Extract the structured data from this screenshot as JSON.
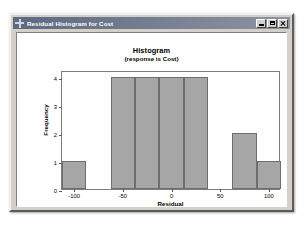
{
  "window": {
    "title": "Residual Histogram for Cost",
    "system_icon": "crosshair-icon",
    "buttons": {
      "minimize": "Minimize",
      "maximize": "Maximize",
      "close": "Close"
    }
  },
  "chart_data": {
    "type": "bar",
    "title": "Histogram",
    "subtitle": "(response is Cost)",
    "xlabel": "Residual",
    "ylabel": "Frequency",
    "grid": false,
    "legend": null,
    "xlim": [
      -112.5,
      112.5
    ],
    "ylim": [
      0,
      4.25
    ],
    "xticks": [
      -100,
      -50,
      0,
      50,
      100
    ],
    "xtick_labels": [
      "-100",
      "-50",
      "0",
      "50",
      "100"
    ],
    "yticks": [
      0,
      1,
      2,
      3,
      4
    ],
    "ytick_labels": [
      "0",
      "1",
      "2",
      "3",
      "4"
    ],
    "bin_width": 25,
    "bar_color": "#a6a6a6",
    "bar_edge_color": "#6e6e6e",
    "bars": [
      {
        "label": "-100",
        "center": -100,
        "left": -112.5,
        "right": -87.5,
        "value": 1
      },
      {
        "label": "-50",
        "center": -50,
        "left": -62.5,
        "right": -37.5,
        "value": 4
      },
      {
        "label": "-25",
        "center": -25,
        "left": -37.5,
        "right": -12.5,
        "value": 4
      },
      {
        "label": "0",
        "center": 0,
        "left": -12.5,
        "right": 12.5,
        "value": 4
      },
      {
        "label": "25",
        "center": 25,
        "left": 12.5,
        "right": 37.5,
        "value": 4
      },
      {
        "label": "75",
        "center": 75,
        "left": 62.5,
        "right": 87.5,
        "value": 2
      },
      {
        "label": "100",
        "center": 100,
        "left": 87.5,
        "right": 112.5,
        "value": 1
      }
    ],
    "categories": [
      "-100",
      "-50",
      "-25",
      "0",
      "25",
      "75",
      "100"
    ],
    "values": [
      1,
      4,
      4,
      4,
      4,
      2,
      1
    ]
  }
}
